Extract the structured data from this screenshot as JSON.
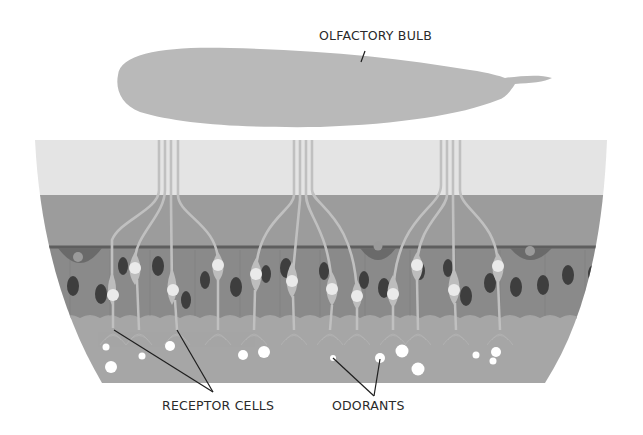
{
  "labels": {
    "olfactory_bulb": "OLFACTORY BULB",
    "receptor_cells": "RECEPTOR CELLS",
    "odorants": "ODORANTS"
  },
  "colors": {
    "background": "#ffffff",
    "bulb": "#b9b9b9",
    "top_band": "#e4e4e4",
    "middle_band": "#9c9c9c",
    "cell_layer": "#8a8a8a",
    "mucus_layer": "#a6a6a6",
    "cell_boundary": "#5e5e5e",
    "dark_nucleus": "#3e3e3e",
    "receptor_body": "#bdbdbd",
    "receptor_nucleus": "#eaeaea",
    "odorant": "#ffffff",
    "leader_line": "#1e1e1e",
    "text": "#2a2a2a"
  }
}
